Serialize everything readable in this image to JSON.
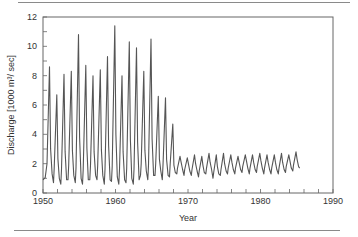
{
  "chart_data": {
    "type": "line",
    "title": "",
    "xlabel": "Year",
    "ylabel": "Discharge [1000 m³/ sec]",
    "xlim": [
      1950,
      1990
    ],
    "ylim": [
      0,
      12
    ],
    "x_ticks": [
      1950,
      1960,
      1970,
      1980,
      1990
    ],
    "y_ticks": [
      0,
      2,
      4,
      6,
      8,
      10,
      12
    ],
    "x_minor_tick_step": 2,
    "y_minor_tick_step": 1,
    "grid": false,
    "legend": null,
    "series": [
      {
        "name": "Discharge",
        "color": "#555555",
        "annual_peaks": [
          {
            "year": 1951,
            "value": 8.6
          },
          {
            "year": 1952,
            "value": 6.7
          },
          {
            "year": 1953,
            "value": 8.1
          },
          {
            "year": 1954,
            "value": 8.3
          },
          {
            "year": 1955,
            "value": 10.8
          },
          {
            "year": 1956,
            "value": 8.7
          },
          {
            "year": 1957,
            "value": 8.0
          },
          {
            "year": 1958,
            "value": 8.4
          },
          {
            "year": 1959,
            "value": 9.3
          },
          {
            "year": 1960,
            "value": 11.4
          },
          {
            "year": 1961,
            "value": 8.0
          },
          {
            "year": 1962,
            "value": 10.3
          },
          {
            "year": 1963,
            "value": 9.9
          },
          {
            "year": 1964,
            "value": 8.3
          },
          {
            "year": 1965,
            "value": 10.5
          },
          {
            "year": 1966,
            "value": 6.6
          },
          {
            "year": 1967,
            "value": 6.5
          },
          {
            "year": 1968,
            "value": 4.7
          },
          {
            "year": 1969,
            "value": 2.5
          },
          {
            "year": 1970,
            "value": 2.4
          },
          {
            "year": 1971,
            "value": 2.6
          },
          {
            "year": 1972,
            "value": 2.5
          },
          {
            "year": 1973,
            "value": 2.7
          },
          {
            "year": 1974,
            "value": 2.6
          },
          {
            "year": 1975,
            "value": 2.7
          },
          {
            "year": 1976,
            "value": 2.6
          },
          {
            "year": 1977,
            "value": 2.5
          },
          {
            "year": 1978,
            "value": 2.6
          },
          {
            "year": 1979,
            "value": 2.6
          },
          {
            "year": 1980,
            "value": 2.7
          },
          {
            "year": 1981,
            "value": 2.6
          },
          {
            "year": 1982,
            "value": 2.6
          },
          {
            "year": 1983,
            "value": 2.7
          },
          {
            "year": 1984,
            "value": 2.6
          },
          {
            "year": 1985,
            "value": 2.8
          }
        ],
        "annual_lows": [
          {
            "year": 1950,
            "value": 0.9
          },
          {
            "year": 1951,
            "value": 1.0
          },
          {
            "year": 1952,
            "value": 0.7
          },
          {
            "year": 1953,
            "value": 0.6
          },
          {
            "year": 1954,
            "value": 0.9
          },
          {
            "year": 1955,
            "value": 0.7
          },
          {
            "year": 1956,
            "value": 0.6
          },
          {
            "year": 1957,
            "value": 0.9
          },
          {
            "year": 1958,
            "value": 0.9
          },
          {
            "year": 1959,
            "value": 0.6
          },
          {
            "year": 1960,
            "value": 0.8
          },
          {
            "year": 1961,
            "value": 0.6
          },
          {
            "year": 1962,
            "value": 0.7
          },
          {
            "year": 1963,
            "value": 0.6
          },
          {
            "year": 1964,
            "value": 1.2
          },
          {
            "year": 1965,
            "value": 0.9
          },
          {
            "year": 1966,
            "value": 1.2
          },
          {
            "year": 1967,
            "value": 0.9
          },
          {
            "year": 1968,
            "value": 1.1
          },
          {
            "year": 1969,
            "value": 1.3
          },
          {
            "year": 1970,
            "value": 1.2
          },
          {
            "year": 1971,
            "value": 1.2
          },
          {
            "year": 1972,
            "value": 1.1
          },
          {
            "year": 1973,
            "value": 1.3
          },
          {
            "year": 1974,
            "value": 1.0
          },
          {
            "year": 1975,
            "value": 1.2
          },
          {
            "year": 1976,
            "value": 1.3
          },
          {
            "year": 1977,
            "value": 1.3
          },
          {
            "year": 1978,
            "value": 1.4
          },
          {
            "year": 1979,
            "value": 1.3
          },
          {
            "year": 1980,
            "value": 1.4
          },
          {
            "year": 1981,
            "value": 1.3
          },
          {
            "year": 1982,
            "value": 1.3
          },
          {
            "year": 1983,
            "value": 1.3
          },
          {
            "year": 1984,
            "value": 1.4
          },
          {
            "year": 1985,
            "value": 1.5
          }
        ],
        "x_end": 1985.4
      }
    ]
  },
  "labels": {
    "xlabel": "Year",
    "ylabel": "Discharge [1000 m³/ sec]"
  }
}
